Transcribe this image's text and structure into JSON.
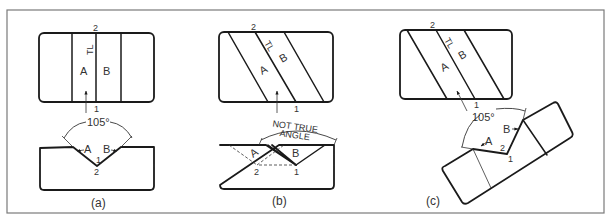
{
  "figure": {
    "panels": [
      {
        "id": "a",
        "caption": "(a)",
        "top_view": {
          "point_top": "2",
          "point_bottom": "1",
          "true_length": "TL",
          "face_a": "A",
          "face_b": "B"
        },
        "bottom_view": {
          "angle": "105°",
          "face_a": "A",
          "face_b": "B",
          "point_upper": "1",
          "point_lower": "2"
        }
      },
      {
        "id": "b",
        "caption": "(b)",
        "top_view": {
          "point_top": "2",
          "point_bottom": "1",
          "true_length": "TL",
          "face_a": "A",
          "face_b": "B"
        },
        "bottom_view": {
          "angle_line1": "NOT TRUE",
          "angle_line2": "ANGLE",
          "face_a": "A",
          "face_b": "B",
          "point_left": "2",
          "point_right": "1"
        }
      },
      {
        "id": "c",
        "caption": "(c)",
        "top_view": {
          "point_top": "2",
          "point_bottom": "1",
          "true_length": "TL",
          "face_a": "A",
          "face_b": "B"
        },
        "aux_view": {
          "angle": "105°",
          "face_a": "A",
          "face_b": "B",
          "point_upper": "2",
          "point_lower": "1"
        }
      }
    ]
  }
}
